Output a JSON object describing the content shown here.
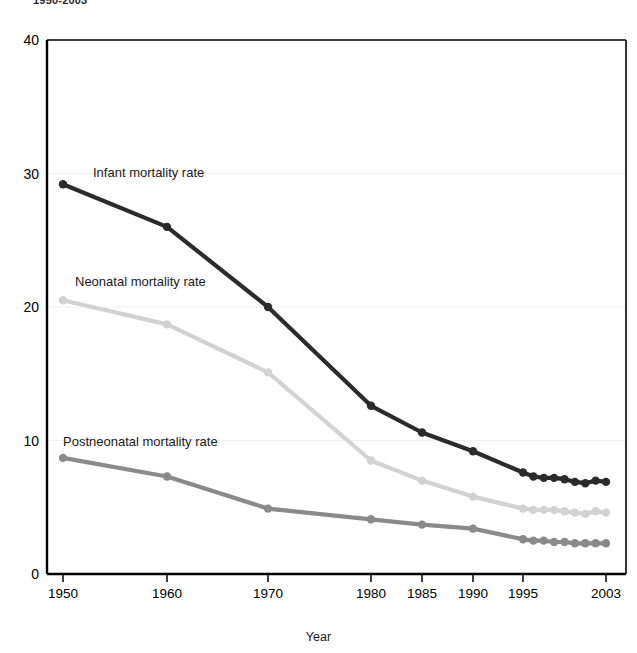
{
  "figure": {
    "title": "1950-2003",
    "xlabel": "Year",
    "ylabel": "Deaths per 1,000 live births"
  },
  "axes": {
    "yticks": [
      "0",
      "10",
      "20",
      "30",
      "40"
    ],
    "xticks": [
      "1950",
      "1960",
      "1970",
      "1980",
      "1985",
      "1990",
      "1995",
      "2003"
    ]
  },
  "labels": {
    "infant": "Infant mortality rate",
    "neonatal": "Neonatal mortality rate",
    "postneonatal": "Postneonatal mortality rate"
  },
  "colors": {
    "infant": "#2b2b2b",
    "neonatal": "#d2d2d2",
    "postneonatal": "#8a8a8a",
    "axis": "#000000",
    "grid": "#f0f0f0"
  },
  "chart_data": {
    "type": "line",
    "title": "1950-2003",
    "xlabel": "Year",
    "ylabel": "Deaths per 1,000 live births",
    "ylim": [
      0,
      40
    ],
    "yticks": [
      0,
      10,
      20,
      30,
      40
    ],
    "xticks": [
      1950,
      1960,
      1970,
      1980,
      1985,
      1990,
      1995,
      2003
    ],
    "x_axis_scale": "non-linear (decades 1950-1980 evenly spaced, then 5-year then annual intervals)",
    "grid": "horizontal gridlines at y ticks",
    "legend": "inline labels adjacent to each series",
    "markers": "filled circles at each data point",
    "x": [
      1950,
      1960,
      1970,
      1980,
      1985,
      1990,
      1995,
      1996,
      1997,
      1998,
      1999,
      2000,
      2001,
      2002,
      2003
    ],
    "series": [
      {
        "name": "Infant mortality rate",
        "color": "#2b2b2b",
        "values": [
          29.2,
          26.0,
          20.0,
          12.6,
          10.6,
          9.2,
          7.6,
          7.3,
          7.2,
          7.2,
          7.1,
          6.9,
          6.8,
          7.0,
          6.9
        ]
      },
      {
        "name": "Neonatal mortality rate",
        "color": "#d2d2d2",
        "values": [
          20.5,
          18.7,
          15.1,
          8.5,
          7.0,
          5.8,
          4.9,
          4.8,
          4.8,
          4.8,
          4.7,
          4.6,
          4.5,
          4.7,
          4.6
        ]
      },
      {
        "name": "Postneonatal mortality rate",
        "color": "#8a8a8a",
        "values": [
          8.7,
          7.3,
          4.9,
          4.1,
          3.7,
          3.4,
          2.6,
          2.5,
          2.5,
          2.4,
          2.4,
          2.3,
          2.3,
          2.3,
          2.3
        ]
      }
    ]
  }
}
